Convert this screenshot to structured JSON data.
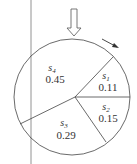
{
  "diagram": {
    "type": "roulette-wheel",
    "pointer": "down-arrow",
    "rotation_indicator": "clockwise-arrow",
    "colors": {
      "stroke": "#444444",
      "text": "#333333",
      "background": "#ffffff"
    },
    "slices": [
      {
        "symbol": "s",
        "subscript": "1",
        "value": "0.11"
      },
      {
        "symbol": "s",
        "subscript": "2",
        "value": "0.15"
      },
      {
        "symbol": "s",
        "subscript": "3",
        "value": "0.29"
      },
      {
        "symbol": "s",
        "subscript": "4",
        "value": "0.45"
      }
    ]
  }
}
